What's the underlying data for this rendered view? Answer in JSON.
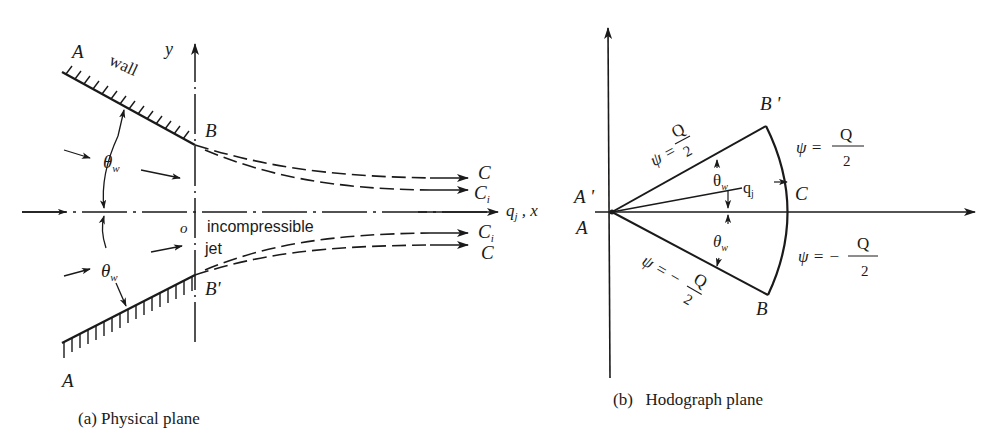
{
  "figure": {
    "panel_a": {
      "caption": "(a)  Physical plane",
      "labels": {
        "wall_top_end": "A",
        "wall_bottom_end": "A",
        "wall": "wall",
        "y_axis": "y",
        "x_axis": "q",
        "x_axis_sub": "j",
        "x_axis_suffix": " , x",
        "origin": "o",
        "lip_top": "B",
        "lip_bottom": "B'",
        "angle_top": "θ",
        "angle_top_sub": "w",
        "angle_bottom": "θ",
        "angle_bottom_sub": "w",
        "jet_text_1": "incompressible",
        "jet_text_2": "jet",
        "free_top": "C",
        "free_top_inner": "C",
        "free_top_inner_sub": "i",
        "free_bottom_inner": "C",
        "free_bottom_inner_sub": "i",
        "free_bottom": "C"
      }
    },
    "panel_b": {
      "caption": "(b)   Hodograph plane",
      "labels": {
        "origin_upper": "A '",
        "origin_lower": "A",
        "corner_top": "B '",
        "corner_bottom": "B",
        "arc_point": "C",
        "ray": "q",
        "ray_sub": "j",
        "angle_top": "θ",
        "angle_top_sub": "w",
        "angle_bottom": "θ",
        "angle_bottom_sub": "w",
        "psi_upper_line": "ψ =",
        "psi_upper_line_num": "Q",
        "psi_upper_line_den": "2",
        "psi_lower_line": "ψ = −",
        "psi_lower_line_num": "Q",
        "psi_lower_line_den": "2",
        "psi_arc_upper": "ψ =",
        "psi_arc_upper_num": "Q",
        "psi_arc_upper_den": "2",
        "psi_arc_lower": "ψ = −",
        "psi_arc_lower_num": "Q",
        "psi_arc_lower_den": "2"
      }
    },
    "colors": {
      "ink": "#1a1a1a",
      "background": "#ffffff"
    }
  }
}
